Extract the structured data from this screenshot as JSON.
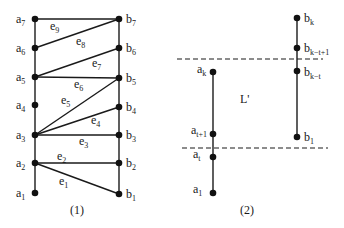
{
  "diagram1": {
    "caption": "(1)",
    "left_nodes": [
      {
        "base": "a",
        "sub": "7",
        "y": 19
      },
      {
        "base": "a",
        "sub": "6",
        "y": 48
      },
      {
        "base": "a",
        "sub": "5",
        "y": 77
      },
      {
        "base": "a",
        "sub": "4",
        "y": 105
      },
      {
        "base": "a",
        "sub": "3",
        "y": 135
      },
      {
        "base": "a",
        "sub": "2",
        "y": 163
      },
      {
        "base": "a",
        "sub": "1",
        "y": 193
      }
    ],
    "right_nodes": [
      {
        "base": "b",
        "sub": "7",
        "y": 19
      },
      {
        "base": "b",
        "sub": "6",
        "y": 48
      },
      {
        "base": "b",
        "sub": "5",
        "y": 78
      },
      {
        "base": "b",
        "sub": "4",
        "y": 107
      },
      {
        "base": "b",
        "sub": "3",
        "y": 135
      },
      {
        "base": "b",
        "sub": "2",
        "y": 163
      },
      {
        "base": "b",
        "sub": "1",
        "y": 194
      }
    ],
    "edges": [
      {
        "label": "e",
        "sub": "9",
        "from": "a7",
        "to": "b7"
      },
      {
        "label": "e",
        "sub": "8",
        "from": "a6",
        "to": "b7"
      },
      {
        "label": "e",
        "sub": "7",
        "from": "a5",
        "to": "b6"
      },
      {
        "label": "e",
        "sub": "6",
        "from": "a5",
        "to": "b5"
      },
      {
        "label": "e",
        "sub": "5",
        "from": "a3",
        "to": "b5"
      },
      {
        "label": "e",
        "sub": "4",
        "from": "a3",
        "to": "b4"
      },
      {
        "label": "e",
        "sub": "3",
        "from": "a3",
        "to": "b3"
      },
      {
        "label": "e",
        "sub": "2",
        "from": "a2",
        "to": "b2"
      },
      {
        "label": "e",
        "sub": "1",
        "from": "a2",
        "to": "b1"
      }
    ]
  },
  "diagram2": {
    "caption": "(2)",
    "region_label": "L'",
    "left_nodes": [
      {
        "base": "a",
        "sub": "k",
        "y": 72
      },
      {
        "base": "a",
        "sub": "t+1",
        "y": 134
      },
      {
        "base": "a",
        "sub": "t",
        "y": 157
      },
      {
        "base": "a",
        "sub": "1",
        "y": 193
      }
    ],
    "right_nodes": [
      {
        "base": "b",
        "sub": "k",
        "y": 18
      },
      {
        "base": "b",
        "sub": "k−t+1",
        "y": 48
      },
      {
        "base": "b",
        "sub": "k−t",
        "y": 71
      },
      {
        "base": "b",
        "sub": "1",
        "y": 137
      }
    ],
    "dashed_lines": [
      {
        "y": 59,
        "x1": 177,
        "x2": 323
      },
      {
        "y": 148,
        "x1": 182,
        "x2": 328
      }
    ]
  },
  "colors": {
    "stroke": "#1a1a1a",
    "node": "#111111",
    "background": "#ffffff"
  }
}
